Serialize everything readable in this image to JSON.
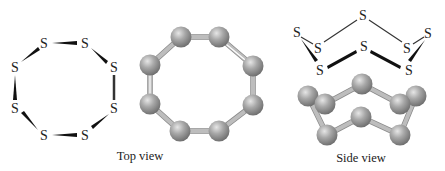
{
  "figure": {
    "element_symbol": "S",
    "ring_size": 8,
    "captions": {
      "top_view": "Top view",
      "side_view": "Side view"
    },
    "colors": {
      "atom_fill": "#9e9e9e",
      "bond_rod": "#bdbdbd",
      "text": "#222222"
    }
  },
  "panels": [
    {
      "id": "top-view-lewis",
      "type": "structural-formula",
      "atoms": 8
    },
    {
      "id": "top-view-ballstick",
      "type": "ball-and-stick",
      "atoms": 8
    },
    {
      "id": "side-view-lewis",
      "type": "structural-formula",
      "atoms": 8
    },
    {
      "id": "side-view-ballstick",
      "type": "ball-and-stick",
      "atoms": 8
    }
  ],
  "labels": {
    "s1": "S",
    "s2": "S",
    "s3": "S",
    "s4": "S",
    "s5": "S",
    "s6": "S",
    "s7": "S",
    "s8": "S",
    "t1": "S",
    "t2": "S",
    "t3": "S",
    "t4": "S",
    "t5": "S",
    "t6": "S",
    "t7": "S",
    "t8": "S"
  }
}
